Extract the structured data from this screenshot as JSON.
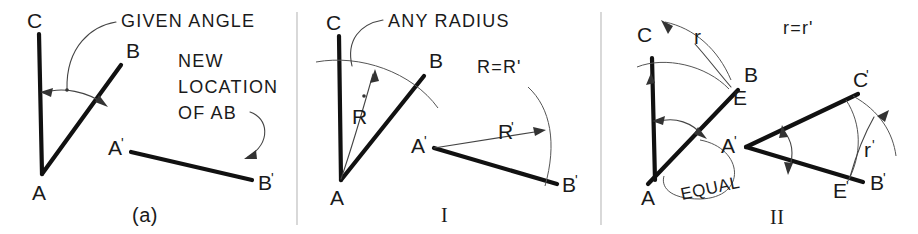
{
  "figure": {
    "title_caption": "(a)",
    "background_color": "#ffffff",
    "ink_color": "#111111"
  },
  "panels": [
    {
      "id": "panel-a",
      "caption": "(a)",
      "notes": [
        {
          "id": "given-angle",
          "text": "GIVEN ANGLE"
        },
        {
          "id": "new-location-1",
          "text": "NEW"
        },
        {
          "id": "new-location-2",
          "text": "LOCATION"
        },
        {
          "id": "new-location-3",
          "text": "OF AB"
        }
      ],
      "points": [
        {
          "id": "pt-c",
          "label": "C",
          "prime": ""
        },
        {
          "id": "pt-b",
          "label": "B",
          "prime": ""
        },
        {
          "id": "pt-a",
          "label": "A",
          "prime": ""
        },
        {
          "id": "pt-a-prime",
          "label": "A",
          "prime": "'"
        },
        {
          "id": "pt-b-prime",
          "label": "B",
          "prime": "'"
        }
      ]
    },
    {
      "id": "panel-i",
      "caption": "I",
      "notes": [
        {
          "id": "any-radius",
          "text": "ANY RADIUS"
        },
        {
          "id": "r-equals-r-prime",
          "text": "R=R'"
        }
      ],
      "points": [
        {
          "id": "pt-c",
          "label": "C",
          "prime": ""
        },
        {
          "id": "pt-b",
          "label": "B",
          "prime": ""
        },
        {
          "id": "pt-a",
          "label": "A",
          "prime": ""
        },
        {
          "id": "pt-a-prime",
          "label": "A",
          "prime": "'"
        },
        {
          "id": "pt-b-prime",
          "label": "B",
          "prime": "'"
        }
      ],
      "dimensions": [
        {
          "id": "radius-r",
          "label": "R",
          "prime": ""
        },
        {
          "id": "radius-r-prime",
          "label": "R",
          "prime": "'"
        }
      ]
    },
    {
      "id": "panel-ii",
      "caption": "II",
      "notes": [
        {
          "id": "r-equals-r-prime",
          "text": "r=r'"
        },
        {
          "id": "equal",
          "text": "EQUAL"
        }
      ],
      "points": [
        {
          "id": "pt-c",
          "label": "C",
          "prime": ""
        },
        {
          "id": "pt-b",
          "label": "B",
          "prime": ""
        },
        {
          "id": "pt-a",
          "label": "A",
          "prime": ""
        },
        {
          "id": "pt-e",
          "label": "E",
          "prime": ""
        },
        {
          "id": "pt-a-prime",
          "label": "A",
          "prime": "'"
        },
        {
          "id": "pt-b-prime",
          "label": "B",
          "prime": "'"
        },
        {
          "id": "pt-c-prime",
          "label": "C",
          "prime": "'"
        },
        {
          "id": "pt-e-prime",
          "label": "E",
          "prime": "'"
        }
      ],
      "dimensions": [
        {
          "id": "chord-r",
          "label": "r",
          "prime": ""
        },
        {
          "id": "chord-r-prime",
          "label": "r",
          "prime": "'"
        }
      ]
    }
  ]
}
